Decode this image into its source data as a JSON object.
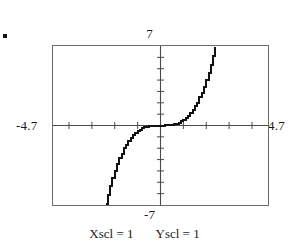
{
  "figure": {
    "bullet": "•",
    "labels": {
      "y_max": "7",
      "y_min": "-7",
      "x_min": "-4.7",
      "x_max": "4.7"
    },
    "scale_notes": [
      {
        "text": "Xscl = 1"
      },
      {
        "text": "Yscl = 1"
      }
    ]
  },
  "chart_data": {
    "type": "line",
    "title": "",
    "xlabel": "",
    "ylabel": "",
    "xlim": [
      -4.7,
      4.7
    ],
    "ylim": [
      -7,
      7
    ],
    "xscl": 1,
    "yscl": 1,
    "grid": false,
    "legend": false,
    "axes": {
      "x_axis_at_y": 0,
      "y_axis_at_x": 0,
      "x_tick_interval": 1,
      "y_tick_interval": 1,
      "x_ticks": [
        -4,
        -3,
        -2,
        -1,
        1,
        2,
        3,
        4
      ],
      "y_ticks": [
        -6,
        -5,
        -4,
        -3,
        -2,
        -1,
        1,
        2,
        3,
        4,
        5,
        6
      ]
    },
    "series": [
      {
        "name": "curve",
        "style": "stepped-pixel-trace",
        "color": "#111111",
        "x": [
          -2.4,
          -2.3,
          -2.2,
          -2.1,
          -2.0,
          -1.9,
          -1.8,
          -1.7,
          -1.6,
          -1.5,
          -1.4,
          -1.3,
          -1.2,
          -1.1,
          -1.0,
          -0.9,
          -0.8,
          -0.7,
          -0.6,
          -0.5,
          -0.4,
          -0.3,
          -0.2,
          -0.1,
          0.0,
          0.1,
          0.2,
          0.3,
          0.4,
          0.5,
          0.6,
          0.7,
          0.8,
          0.9,
          1.0,
          1.1,
          1.2,
          1.3,
          1.4,
          1.5,
          1.6,
          1.7,
          1.8,
          1.9,
          2.0,
          2.1,
          2.2,
          2.3,
          2.4
        ],
        "y": [
          -6.9,
          -6.1,
          -5.3,
          -4.6,
          -4.0,
          -3.4,
          -2.9,
          -2.5,
          -2.0,
          -1.7,
          -1.4,
          -1.1,
          -0.86,
          -0.67,
          -0.5,
          -0.36,
          -0.26,
          -0.17,
          -0.11,
          -0.06,
          -0.03,
          -0.01,
          -0.004,
          0.0,
          0.0,
          0.0,
          0.004,
          0.01,
          0.03,
          0.06,
          0.11,
          0.17,
          0.26,
          0.36,
          0.5,
          0.67,
          0.86,
          1.1,
          1.4,
          1.7,
          2.0,
          2.5,
          2.9,
          3.4,
          4.0,
          4.6,
          5.3,
          6.1,
          6.9
        ]
      }
    ]
  }
}
